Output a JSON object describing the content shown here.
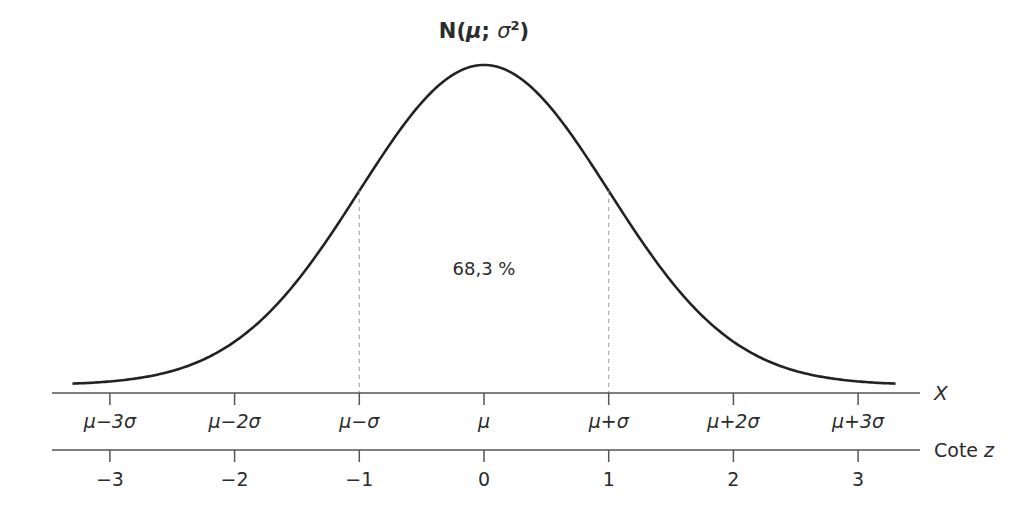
{
  "chart_data": {
    "type": "line",
    "title_parts": {
      "prefix": "N(",
      "mu": "μ",
      "sep": "; ",
      "sigma": "σ",
      "sup": "2",
      "suffix": ")"
    },
    "x_axis_label": "X",
    "z_axis_label": "Cote z",
    "x_tick_labels": [
      "μ−3σ",
      "μ−2σ",
      "μ−σ",
      "μ",
      "μ+σ",
      "μ+2σ",
      "μ+3σ"
    ],
    "z_tick_labels": [
      "−3",
      "−2",
      "−1",
      "0",
      "1",
      "2",
      "3"
    ],
    "z_values": [
      -3,
      -2,
      -1,
      0,
      1,
      2,
      3
    ],
    "xlim": [
      -3.3,
      3.3
    ],
    "annotation": "68,3 %",
    "shaded_interval": [
      -1,
      1
    ],
    "dashed_lines_at": [
      -1,
      1
    ],
    "grid": false,
    "legend": null,
    "series": [
      {
        "name": "density",
        "x": [
          -3.3,
          -3,
          -2.5,
          -2,
          -1.5,
          -1,
          -0.5,
          0,
          0.5,
          1,
          1.5,
          2,
          2.5,
          3,
          3.3
        ],
        "values": [
          0.0017,
          0.0044,
          0.0175,
          0.054,
          0.1295,
          0.242,
          0.3521,
          0.3989,
          0.3521,
          0.242,
          0.1295,
          0.054,
          0.0175,
          0.0044,
          0.0017
        ]
      }
    ]
  },
  "colors": {
    "curve": "#222222",
    "axis": "#555555",
    "dashed": "#999999",
    "text": "#2b2b2b"
  }
}
